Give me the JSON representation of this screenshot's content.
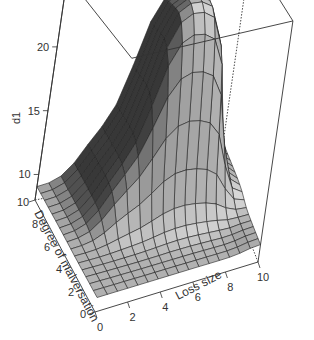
{
  "chart_data": {
    "type": "surface3d",
    "title": "",
    "xlabel": "Loss size",
    "ylabel": "Degree of malversation",
    "zlabel": "d1",
    "x_ticks": [
      0,
      2,
      4,
      6,
      8,
      10
    ],
    "y_ticks": [
      0,
      2,
      4,
      6,
      8,
      10
    ],
    "z_ticks": [
      10,
      15,
      20
    ],
    "xlim": [
      0,
      10
    ],
    "ylim": [
      0,
      10
    ],
    "zlim": [
      8,
      24
    ],
    "grid_n": 16,
    "surface_features": {
      "base_level": 9,
      "step_level": 13,
      "plateau_level": 23.5,
      "plateau_x_range": [
        4.5,
        8.5
      ],
      "plateau_y_range": [
        5.5,
        10
      ],
      "step_y_threshold": 4.5,
      "dip_x": 9
    },
    "colors": {
      "surface_light": "#d4d4d4",
      "surface_dark": "#3a3a3a",
      "mesh_line": "#222222",
      "box_line": "#333333",
      "background": "#ffffff"
    }
  }
}
